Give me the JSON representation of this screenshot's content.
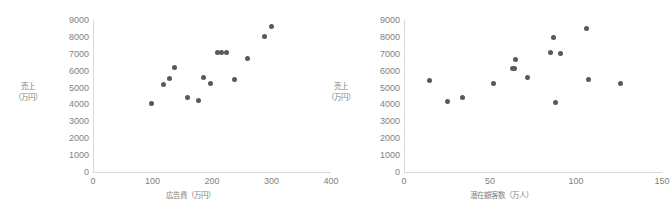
{
  "chart_data": [
    {
      "type": "scatter",
      "id": "left",
      "title": "",
      "xlabel": "広告費（万円）",
      "ylabel": "売上\n（万円）",
      "ylabel_lines": [
        "売上",
        "（万円）"
      ],
      "xlim": [
        0,
        400
      ],
      "ylim": [
        0,
        9000
      ],
      "xticks": [
        0,
        100,
        200,
        300,
        400
      ],
      "xticklabels": [
        "0",
        "100",
        "200",
        "300",
        "400"
      ],
      "yticks": [
        0,
        1000,
        2000,
        3000,
        4000,
        5000,
        6000,
        7000,
        8000,
        9000
      ],
      "yticklabels": [
        "0",
        "1000",
        "2000",
        "3000",
        "4000",
        "5000",
        "6000",
        "7000",
        "8000",
        "9000"
      ],
      "grid": false,
      "legend": null,
      "marker_color": "#595959",
      "axis_color": "#d9d9d9",
      "tick_text_color": "#7f7f7f",
      "points": [
        {
          "x": 99,
          "y": 4050
        },
        {
          "x": 119,
          "y": 5200
        },
        {
          "x": 128,
          "y": 5550
        },
        {
          "x": 137,
          "y": 6200
        },
        {
          "x": 159,
          "y": 4400
        },
        {
          "x": 177,
          "y": 4250
        },
        {
          "x": 186,
          "y": 5600
        },
        {
          "x": 197,
          "y": 5250
        },
        {
          "x": 209,
          "y": 7050
        },
        {
          "x": 224,
          "y": 7050
        },
        {
          "x": 237,
          "y": 5450
        },
        {
          "x": 259,
          "y": 6700
        },
        {
          "x": 289,
          "y": 8050
        },
        {
          "x": 300,
          "y": 8600
        },
        {
          "x": 216,
          "y": 7050
        }
      ]
    },
    {
      "type": "scatter",
      "id": "right",
      "title": "",
      "xlabel": "潜在顧客数（万人）",
      "ylabel": "売上\n（万円）",
      "ylabel_lines": [
        "売上",
        "（万円）"
      ],
      "xlim": [
        0,
        150
      ],
      "ylim": [
        0,
        9000
      ],
      "xticks": [
        0,
        50,
        100,
        150
      ],
      "xticklabels": [
        "0",
        "50",
        "100",
        "150"
      ],
      "yticks": [
        0,
        1000,
        2000,
        3000,
        4000,
        5000,
        6000,
        7000,
        8000,
        9000
      ],
      "yticklabels": [
        "0",
        "1000",
        "2000",
        "3000",
        "4000",
        "5000",
        "6000",
        "7000",
        "8000",
        "9000"
      ],
      "grid": false,
      "legend": null,
      "marker_color": "#595959",
      "axis_color": "#d9d9d9",
      "tick_text_color": "#7f7f7f",
      "points": [
        {
          "x": 15,
          "y": 5400
        },
        {
          "x": 25,
          "y": 4200
        },
        {
          "x": 34,
          "y": 4400
        },
        {
          "x": 52,
          "y": 5250
        },
        {
          "x": 63,
          "y": 6150
        },
        {
          "x": 65,
          "y": 6650
        },
        {
          "x": 72,
          "y": 5600
        },
        {
          "x": 85,
          "y": 7050
        },
        {
          "x": 87,
          "y": 7950
        },
        {
          "x": 88,
          "y": 4100
        },
        {
          "x": 91,
          "y": 7000
        },
        {
          "x": 106,
          "y": 8500
        },
        {
          "x": 107,
          "y": 5500
        },
        {
          "x": 126,
          "y": 5250
        },
        {
          "x": 64,
          "y": 6150
        }
      ]
    }
  ]
}
